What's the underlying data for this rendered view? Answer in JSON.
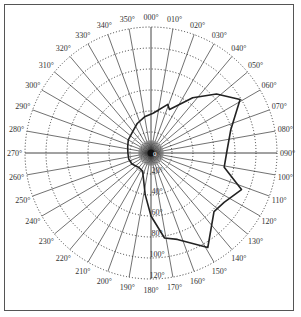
{
  "chart_data": {
    "type": "polar_line",
    "title": "",
    "angular_axis": {
      "direction": "clockwise",
      "zero_at": "top",
      "tick_step_deg": 10,
      "tick_labels": [
        "000°",
        "010°",
        "020°",
        "030°",
        "040°",
        "050°",
        "060°",
        "070°",
        "080°",
        "090°",
        "100°",
        "110°",
        "120°",
        "130°",
        "140°",
        "150°",
        "160°",
        "170°",
        "180°",
        "190°",
        "200°",
        "210°",
        "220°",
        "230°",
        "240°",
        "250°",
        "260°",
        "270°",
        "280°",
        "290°",
        "300°",
        "310°",
        "320°",
        "330°",
        "340°",
        "350°"
      ]
    },
    "radial_axis": {
      "range": [
        0,
        120
      ],
      "ticks": [
        0,
        20,
        40,
        60,
        80,
        100,
        120
      ],
      "tick_labels": [
        "0",
        "20°",
        "40°",
        "60°",
        "80°",
        "100°",
        "120°"
      ],
      "label_angle_deg": 180,
      "grid": "dotted"
    },
    "spokes": "fine radial lines every 10° (denser near center)",
    "series": [
      {
        "name": "profile",
        "points": [
          {
            "angle": 3,
            "r": 38
          },
          {
            "angle": 19,
            "r": 49
          },
          {
            "angle": 23,
            "r": 45
          },
          {
            "angle": 37,
            "r": 66
          },
          {
            "angle": 48,
            "r": 84
          },
          {
            "angle": 59,
            "r": 99
          },
          {
            "angle": 74,
            "r": 79
          },
          {
            "angle": 90,
            "r": 72
          },
          {
            "angle": 101,
            "r": 71
          },
          {
            "angle": 112,
            "r": 93
          },
          {
            "angle": 124,
            "r": 84
          },
          {
            "angle": 133,
            "r": 82
          },
          {
            "angle": 149,
            "r": 105
          },
          {
            "angle": 163,
            "r": 86
          },
          {
            "angle": 171,
            "r": 82
          },
          {
            "angle": 180,
            "r": 60
          },
          {
            "angle": 188,
            "r": 40
          },
          {
            "angle": 196,
            "r": 26
          },
          {
            "angle": 205,
            "r": 19
          },
          {
            "angle": 220,
            "r": 18
          },
          {
            "angle": 240,
            "r": 21
          },
          {
            "angle": 255,
            "r": 22
          },
          {
            "angle": 270,
            "r": 22
          },
          {
            "angle": 285,
            "r": 23
          },
          {
            "angle": 300,
            "r": 25
          },
          {
            "angle": 320,
            "r": 27
          },
          {
            "angle": 335,
            "r": 31
          },
          {
            "angle": 350,
            "r": 35
          }
        ]
      }
    ]
  },
  "labels": {
    "center": "0"
  }
}
